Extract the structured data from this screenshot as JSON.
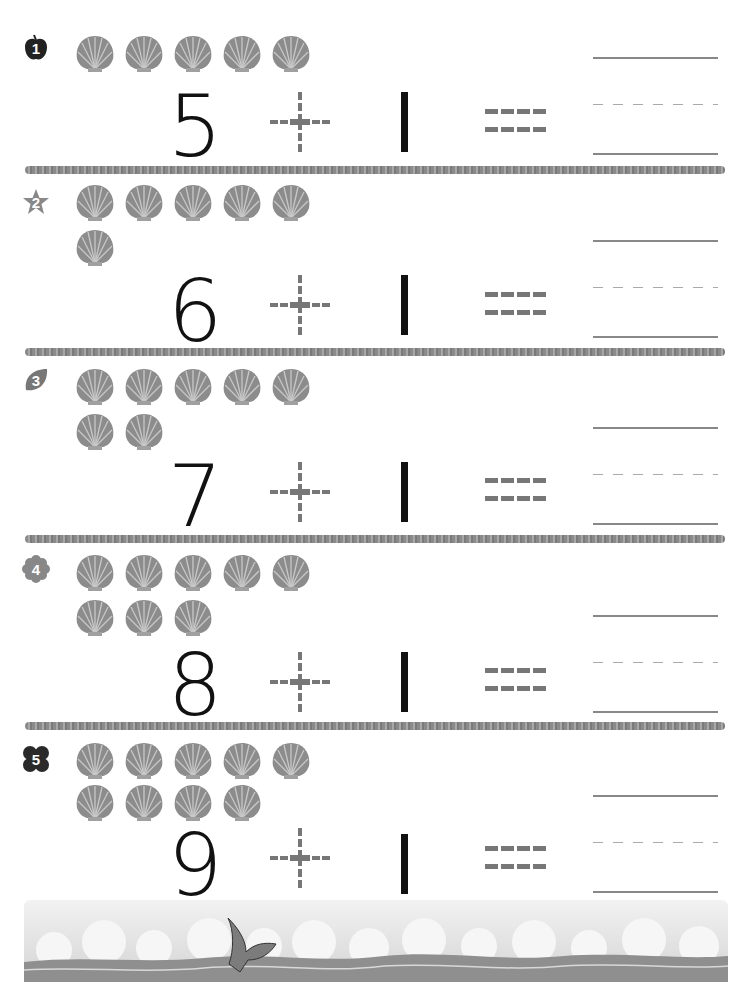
{
  "worksheet": {
    "rows": [
      {
        "badge": "1",
        "badge_shape": "apple-icon",
        "shells": 5,
        "addend1": "5",
        "operator": "+",
        "addend2": "1",
        "equals": "="
      },
      {
        "badge": "2",
        "badge_shape": "star-icon",
        "shells": 6,
        "addend1": "6",
        "operator": "+",
        "addend2": "1",
        "equals": "="
      },
      {
        "badge": "3",
        "badge_shape": "leaf-icon",
        "shells": 7,
        "addend1": "7",
        "operator": "+",
        "addend2": "1",
        "equals": "="
      },
      {
        "badge": "4",
        "badge_shape": "flower-icon",
        "shells": 8,
        "addend1": "8",
        "operator": "+",
        "addend2": "1",
        "equals": "="
      },
      {
        "badge": "5",
        "badge_shape": "butterfly-icon",
        "shells": 9,
        "addend1": "9",
        "operator": "+",
        "addend2": "1",
        "equals": "="
      }
    ]
  },
  "colors": {
    "shell": "#8c8c8c",
    "ink": "#111111",
    "dashed": "#777777",
    "divider": "#909090"
  }
}
